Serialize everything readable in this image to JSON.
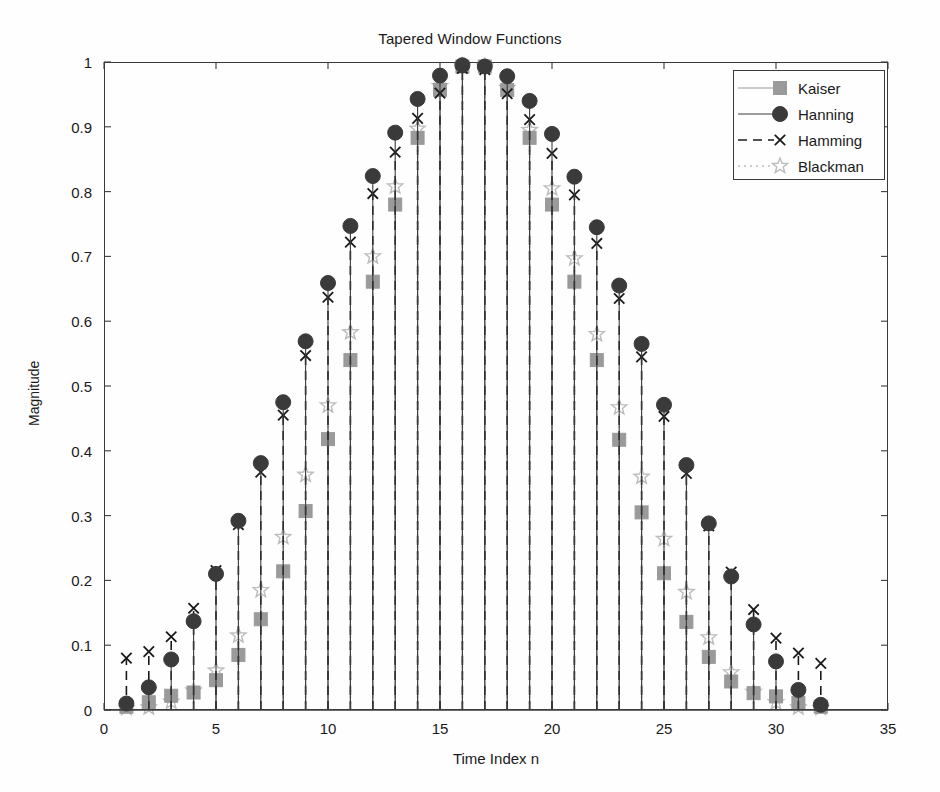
{
  "chart_data": {
    "type": "line",
    "render": "stem",
    "title": "Tapered Window Functions",
    "xlabel": "Time Index n",
    "ylabel": "Magnitude",
    "xlim": [
      0,
      35
    ],
    "ylim": [
      0,
      1
    ],
    "xticks": [
      0,
      5,
      10,
      15,
      20,
      25,
      30,
      35
    ],
    "xtick_labels": [
      "0",
      "5",
      "10",
      "15",
      "20",
      "25",
      "30",
      "35"
    ],
    "yticks": [
      0,
      0.1,
      0.2,
      0.3,
      0.4,
      0.5,
      0.6,
      0.7,
      0.8,
      0.9,
      1
    ],
    "ytick_labels": [
      "0",
      "0.1",
      "0.2",
      "0.3",
      "0.4",
      "0.5",
      "0.6",
      "0.7",
      "0.8",
      "0.9",
      "1"
    ],
    "grid": false,
    "legend_position": "upper right",
    "x": [
      1,
      2,
      3,
      4,
      5,
      6,
      7,
      8,
      9,
      10,
      11,
      12,
      13,
      14,
      15,
      16,
      17,
      18,
      19,
      20,
      21,
      22,
      23,
      24,
      25,
      26,
      27,
      28,
      29,
      30,
      31,
      32
    ],
    "series": [
      {
        "name": "Kaiser",
        "marker": "square",
        "color": "#9a9a9a",
        "line_style": "solid",
        "values": [
          0.005,
          0.012,
          0.022,
          0.027,
          0.046,
          0.085,
          0.14,
          0.214,
          0.307,
          0.418,
          0.54,
          0.661,
          0.78,
          0.883,
          0.957,
          0.993,
          0.993,
          0.957,
          0.883,
          0.78,
          0.661,
          0.54,
          0.417,
          0.305,
          0.211,
          0.136,
          0.082,
          0.044,
          0.026,
          0.021,
          0.011,
          0.005
        ]
      },
      {
        "name": "Hanning",
        "marker": "circle",
        "color": "#3a3a3a",
        "line_style": "solid",
        "values": [
          0.01,
          0.035,
          0.078,
          0.137,
          0.21,
          0.292,
          0.381,
          0.475,
          0.569,
          0.659,
          0.747,
          0.824,
          0.891,
          0.943,
          0.979,
          0.995,
          0.993,
          0.978,
          0.94,
          0.889,
          0.823,
          0.745,
          0.655,
          0.565,
          0.471,
          0.378,
          0.288,
          0.206,
          0.132,
          0.075,
          0.031,
          0.008
        ]
      },
      {
        "name": "Hamming",
        "marker": "x",
        "color": "#1a1a1a",
        "line_style": "dashed",
        "values": [
          0.08,
          0.09,
          0.113,
          0.157,
          0.215,
          0.286,
          0.367,
          0.455,
          0.547,
          0.637,
          0.722,
          0.797,
          0.861,
          0.913,
          0.952,
          0.99,
          0.988,
          0.951,
          0.911,
          0.859,
          0.795,
          0.72,
          0.635,
          0.545,
          0.453,
          0.365,
          0.284,
          0.213,
          0.155,
          0.111,
          0.088,
          0.072
        ]
      },
      {
        "name": "Blackman",
        "marker": "star",
        "color": "#bcbcbc",
        "line_style": "dotted",
        "values": [
          0.003,
          0.004,
          0.013,
          0.03,
          0.061,
          0.115,
          0.185,
          0.267,
          0.363,
          0.47,
          0.583,
          0.7,
          0.808,
          0.897,
          0.963,
          0.994,
          0.993,
          0.96,
          0.895,
          0.805,
          0.697,
          0.58,
          0.467,
          0.36,
          0.264,
          0.182,
          0.112,
          0.058,
          0.028,
          0.012,
          0.004,
          0.003
        ]
      }
    ]
  },
  "legend": {
    "entries": [
      "Kaiser",
      "Hanning",
      "Hamming",
      "Blackman"
    ]
  },
  "colors": {
    "axis": "#3a3a3a",
    "background": "#fefefe",
    "kaiser": "#9a9a9a",
    "hanning": "#3a3a3a",
    "hamming": "#1a1a1a",
    "blackman": "#bcbcbc"
  }
}
